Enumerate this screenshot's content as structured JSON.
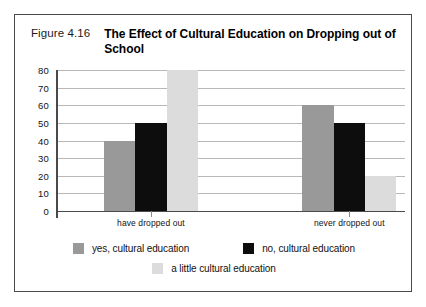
{
  "figure": {
    "number": "Figure 4.16",
    "title": "The Effect of Cultural Education on Dropping out of School"
  },
  "chart_data": {
    "type": "bar",
    "title": "The Effect of Cultural Education on Dropping out of School",
    "categories": [
      "have dropped out",
      "never dropped out"
    ],
    "series": [
      {
        "name": "yes, cultural education",
        "values": [
          40,
          60
        ],
        "color": "#999999"
      },
      {
        "name": "no, cultural education",
        "values": [
          50,
          50
        ],
        "color": "#0d0d0d"
      },
      {
        "name": "a little cultural education",
        "values": [
          80,
          20
        ],
        "color": "#dcdcdc"
      }
    ],
    "xlabel": "",
    "ylabel": "",
    "ylim": [
      0,
      80
    ],
    "ytick_step": 10,
    "yticks": [
      80,
      70,
      60,
      50,
      40,
      30,
      20,
      10,
      0
    ],
    "grid": true,
    "legend_position": "bottom"
  },
  "colors": {
    "frame": "#4a4a4a",
    "gridline": "#b8b8b8",
    "axis": "#4a4a4a",
    "text": "#111111",
    "background": "#ffffff"
  }
}
